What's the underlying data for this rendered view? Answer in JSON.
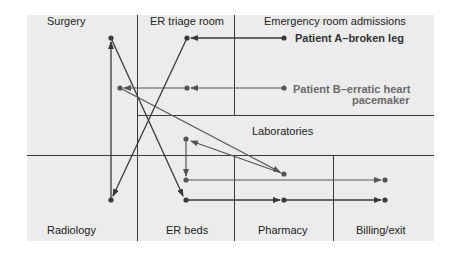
{
  "diagram": {
    "type": "patient-flow",
    "colors": {
      "background": "#ececec",
      "lines": "#3a3a3a",
      "patient_a": "#333333",
      "patient_b": "#6a6a6a"
    },
    "areas": {
      "surgery": "Surgery",
      "er_triage": "ER triage room",
      "admissions": "Emergency room admissions",
      "laboratories": "Laboratories",
      "radiology": "Radiology",
      "er_beds": "ER beds",
      "pharmacy": "Pharmacy",
      "billing": "Billing/exit"
    },
    "patients": {
      "a": {
        "label": "Patient A–broken leg"
      },
      "b": {
        "label_line1": "Patient B–erratic heart",
        "label_line2": "pacemaker"
      }
    },
    "flows": {
      "patient_a": [
        "Emergency room admissions",
        "ER triage room",
        "Radiology",
        "Surgery",
        "ER beds",
        "Pharmacy",
        "Billing/exit"
      ],
      "patient_b": [
        "Emergency room admissions",
        "ER triage room",
        "Surgery",
        "Laboratories",
        "ER beds",
        "Billing/exit"
      ]
    }
  }
}
